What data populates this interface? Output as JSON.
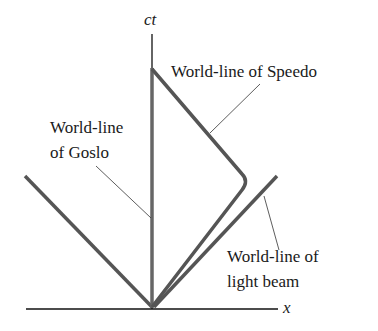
{
  "diagram": {
    "axes": {
      "x_label": "x",
      "y_label": "ct"
    },
    "labels": {
      "speedo": "World-line of Speedo",
      "goslo_1": "World-line",
      "goslo_2": "of Goslo",
      "light_1": "World-line of",
      "light_2": "light beam"
    },
    "colors": {
      "worldline": "#555555",
      "axis": "#111111",
      "text": "#1a1a1a"
    }
  }
}
